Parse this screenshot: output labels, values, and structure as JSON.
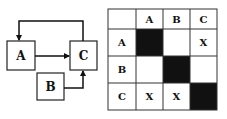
{
  "diagram": {
    "nodes": [
      {
        "id": "A",
        "label": "A"
      },
      {
        "id": "B",
        "label": "B"
      },
      {
        "id": "C",
        "label": "C"
      }
    ],
    "edges": [
      {
        "from": "A",
        "to": "C"
      },
      {
        "from": "B",
        "to": "C"
      },
      {
        "from": "C",
        "to": "A"
      }
    ]
  },
  "matrix": {
    "col_headers": [
      "A",
      "B",
      "C"
    ],
    "rows": [
      {
        "header": "A",
        "cells": [
          "",
          "",
          "X"
        ]
      },
      {
        "header": "B",
        "cells": [
          "",
          "",
          ""
        ]
      },
      {
        "header": "C",
        "cells": [
          "X",
          "X",
          ""
        ]
      }
    ],
    "diagonal_fill": "#111111"
  }
}
